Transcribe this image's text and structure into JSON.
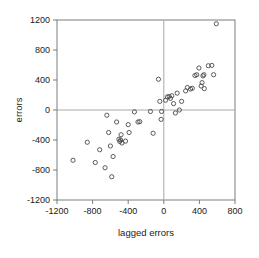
{
  "chart_data": {
    "type": "scatter",
    "title": "",
    "xlabel": "lagged errors",
    "ylabel": "errors",
    "xlim": [
      -1200,
      800
    ],
    "ylim": [
      -1200,
      1200
    ],
    "xticks": [
      -1200,
      -800,
      -400,
      0,
      400,
      800
    ],
    "yticks": [
      -1200,
      -800,
      -400,
      0,
      400,
      800,
      1200
    ],
    "xtick_labels": [
      "-1200",
      "-800",
      "-400",
      "0",
      "400",
      "800"
    ],
    "ytick_labels": [
      "-1200",
      "-800",
      "-400",
      "0",
      "400",
      "800",
      "1200"
    ],
    "grid": false,
    "reference_lines": {
      "vertical_x": 0,
      "horizontal_y": 0,
      "color": "#a8a8a8"
    },
    "marker": {
      "shape": "open-circle",
      "radius": 2.1,
      "stroke": "#4a4a4a",
      "fill": "none"
    },
    "frame_color": "#7d7d7d",
    "legend": null,
    "series": [
      {
        "name": "errors vs lagged errors",
        "points": [
          [
            -1020,
            -670
          ],
          [
            -860,
            -430
          ],
          [
            -770,
            -700
          ],
          [
            -720,
            -530
          ],
          [
            -660,
            -770
          ],
          [
            -640,
            -70
          ],
          [
            -620,
            -300
          ],
          [
            -600,
            -480
          ],
          [
            -585,
            -890
          ],
          [
            -570,
            -620
          ],
          [
            -530,
            -160
          ],
          [
            -505,
            -390
          ],
          [
            -495,
            -420
          ],
          [
            -485,
            -400
          ],
          [
            -480,
            -330
          ],
          [
            -470,
            -440
          ],
          [
            -430,
            -415
          ],
          [
            -400,
            -195
          ],
          [
            -390,
            -300
          ],
          [
            -330,
            -25
          ],
          [
            -290,
            -160
          ],
          [
            -270,
            -155
          ],
          [
            -150,
            -20
          ],
          [
            -120,
            -310
          ],
          [
            -60,
            410
          ],
          [
            -45,
            115
          ],
          [
            -30,
            -125
          ],
          [
            -25,
            -20
          ],
          [
            20,
            130
          ],
          [
            40,
            175
          ],
          [
            60,
            180
          ],
          [
            75,
            155
          ],
          [
            90,
            190
          ],
          [
            110,
            85
          ],
          [
            130,
            -40
          ],
          [
            150,
            225
          ],
          [
            175,
            0
          ],
          [
            200,
            115
          ],
          [
            245,
            255
          ],
          [
            265,
            300
          ],
          [
            300,
            280
          ],
          [
            320,
            290
          ],
          [
            350,
            460
          ],
          [
            370,
            470
          ],
          [
            395,
            560
          ],
          [
            420,
            320
          ],
          [
            430,
            365
          ],
          [
            440,
            455
          ],
          [
            450,
            470
          ],
          [
            455,
            285
          ],
          [
            500,
            590
          ],
          [
            540,
            595
          ],
          [
            560,
            470
          ],
          [
            590,
            1150
          ]
        ]
      }
    ]
  }
}
